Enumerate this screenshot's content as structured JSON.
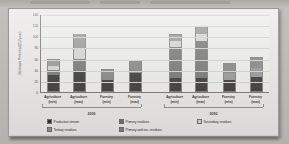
{
  "chart_data": {
    "type": "bar",
    "subtype": "stacked-bar-grouped",
    "title": "",
    "xlabel": "",
    "ylabel": "Biomass Potential (EJ/year)",
    "ylim": [
      0,
      140
    ],
    "yticks": [
      "140",
      "120",
      "100",
      "80",
      "60",
      "40",
      "20",
      "0"
    ],
    "ytick_values": [
      140,
      120,
      100,
      80,
      60,
      40,
      20,
      0
    ],
    "grid": true,
    "legend_position": "bottom",
    "groups": [
      "2030",
      "2050"
    ],
    "categories": [
      "Agriculture (min)",
      "Agriculture (max)",
      "Forestry (min)",
      "Forestry (max)",
      "Agriculture (min)",
      "Agriculture (max)",
      "Forestry (min)",
      "Forestry (max)"
    ],
    "series": [
      {
        "name": "Production stream",
        "color": "#2b2b2b",
        "values": [
          30,
          38,
          22,
          35,
          25,
          25,
          22,
          26
        ]
      },
      {
        "name": "Primary residues",
        "color": "#6b6b6b",
        "values": [
          10,
          22,
          0,
          0,
          56,
          68,
          0,
          0
        ]
      },
      {
        "name": "Secondary residues",
        "color": "#d2d2d2",
        "values": [
          8,
          18,
          0,
          0,
          12,
          12,
          0,
          0
        ]
      },
      {
        "name": "Tertiary residues",
        "color": "#8f8f8f",
        "values": [
          12,
          27,
          0,
          0,
          12,
          13,
          13,
          18
        ]
      },
      {
        "name": "Primary and sec. residues",
        "color": "#7c7c7c",
        "values": [
          0,
          0,
          20,
          22,
          0,
          0,
          17,
          18
        ]
      }
    ],
    "totals": [
      60,
      105,
      42,
      57,
      105,
      118,
      52,
      62
    ]
  },
  "axis": {
    "y_title": "Biomass Potential (EJ/year)",
    "ticks": [
      "140",
      "120",
      "100",
      "80",
      "60",
      "40",
      "20",
      "0"
    ]
  },
  "xaxis": {
    "cats": [
      {
        "name": "Agriculture",
        "sub": "(min)"
      },
      {
        "name": "Agriculture",
        "sub": "(max)"
      },
      {
        "name": "Forestry",
        "sub": "(min)"
      },
      {
        "name": "Forestry",
        "sub": "(max)"
      },
      {
        "name": "Agriculture",
        "sub": "(min)"
      },
      {
        "name": "Agriculture",
        "sub": "(max)"
      },
      {
        "name": "Forestry",
        "sub": "(min)"
      },
      {
        "name": "Forestry",
        "sub": "(max)"
      }
    ],
    "groups": [
      "2030",
      "2050"
    ]
  },
  "legend": {
    "items": [
      {
        "label": "Production stream",
        "color": "#2b2b2b"
      },
      {
        "label": "Primary residues",
        "color": "#6b6b6b"
      },
      {
        "label": "Secondary residues",
        "color": "#d2d2d2"
      },
      {
        "label": "Tertiary residues",
        "color": "#8f8f8f"
      },
      {
        "label": "Primary and sec. residues",
        "color": "#7c7c7c"
      }
    ]
  }
}
